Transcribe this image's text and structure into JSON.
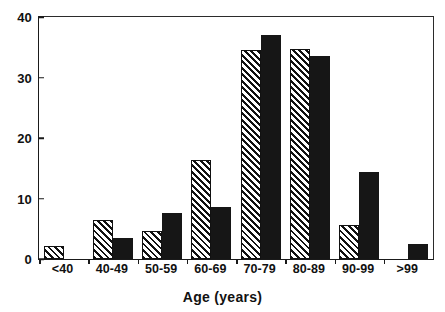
{
  "figure": {
    "background_color": "#ffffff",
    "foreground_color": "#111111"
  },
  "axes": {
    "x_title": "Age (years)",
    "y_title": "",
    "y_ticks": [
      "0",
      "10",
      "20",
      "30",
      "40"
    ],
    "x_ticks": [
      "<40",
      "40-49",
      "50-59",
      "60-69",
      "70-79",
      "80-89",
      "90-99",
      ">99"
    ]
  },
  "chart_data": {
    "type": "bar",
    "title": "",
    "subtitle": "",
    "xlabel": "Age (years)",
    "ylabel": "",
    "ylim": [
      0,
      40
    ],
    "ytick_values": [
      0,
      10,
      20,
      30,
      40
    ],
    "grid": false,
    "legend": false,
    "legend_position": "none",
    "bar_style": [
      "hatched-diagonal",
      "solid-black"
    ],
    "categories": [
      "<40",
      "40-49",
      "50-59",
      "60-69",
      "70-79",
      "80-89",
      "90-99",
      ">99"
    ],
    "series": [
      {
        "name": "series-hatched",
        "fill": "hatched-diagonal",
        "color": "#ffffff",
        "edge_color": "#111111",
        "values": [
          2.2,
          6.5,
          4.6,
          16.3,
          34.6,
          34.7,
          5.6,
          0
        ]
      },
      {
        "name": "series-solid",
        "fill": "solid",
        "color": "#161616",
        "edge_color": "#161616",
        "values": [
          0,
          3.4,
          7.6,
          8.6,
          37.0,
          33.6,
          14.4,
          2.5
        ]
      }
    ]
  }
}
